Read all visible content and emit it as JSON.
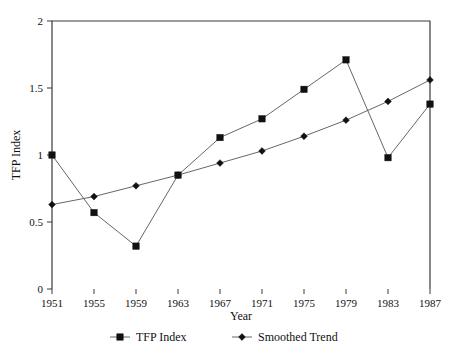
{
  "chart_data": {
    "type": "line",
    "title": "",
    "xlabel": "Year",
    "ylabel": "TFP Index",
    "categories": [
      "1951",
      "1955",
      "1959",
      "1963",
      "1967",
      "1971",
      "1975",
      "1979",
      "1983",
      "1987"
    ],
    "x": [
      1951,
      1955,
      1959,
      1963,
      1967,
      1971,
      1975,
      1979,
      1983,
      1987
    ],
    "series": [
      {
        "name": "TFP Index",
        "marker": "square",
        "values": [
          1.0,
          0.57,
          0.32,
          0.85,
          1.13,
          1.27,
          1.49,
          1.71,
          0.98,
          1.38
        ]
      },
      {
        "name": "Smoothed Trend",
        "marker": "diamond",
        "values": [
          0.63,
          0.69,
          0.77,
          0.85,
          0.94,
          1.03,
          1.14,
          1.26,
          1.4,
          1.56
        ]
      }
    ],
    "ylim": [
      0,
      2
    ],
    "yticks": [
      0,
      0.5,
      1,
      1.5,
      2
    ],
    "ytick_labels": [
      "0",
      "0.5",
      "1",
      "1.5",
      "2"
    ],
    "xtick_labels": [
      "1951",
      "1955",
      "1959",
      "1963",
      "1967",
      "1971",
      "1975",
      "1979",
      "1983",
      "1987"
    ],
    "grid": false,
    "legend_position": "bottom",
    "legend_entries": [
      "TFP Index",
      "Smoothed Trend"
    ],
    "line_color": "#555555",
    "marker_color": "#111111",
    "axis_color": "#3a3a3a"
  }
}
